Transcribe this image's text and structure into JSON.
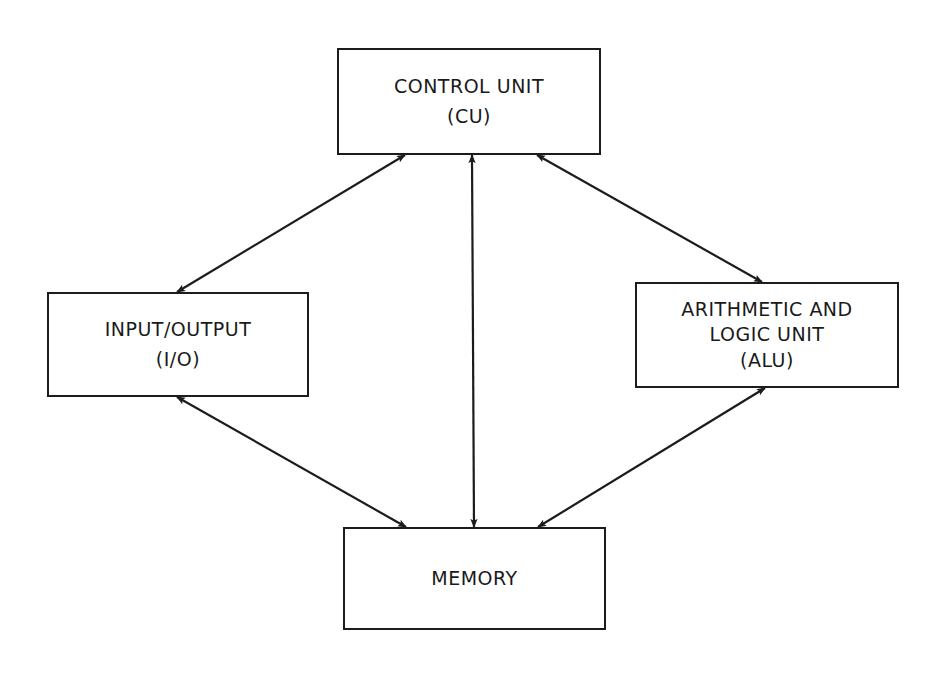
{
  "diagram": {
    "title": "",
    "background": "#ffffff",
    "stroke_color": "#1c1c1c",
    "nodes": {
      "cu": {
        "lines": [
          "CONTROL UNIT",
          "(CU)"
        ]
      },
      "io": {
        "lines": [
          "INPUT/OUTPUT",
          "(I/O)"
        ]
      },
      "alu": {
        "lines": [
          "ARITHMETIC AND",
          "LOGIC UNIT",
          "(ALU)"
        ]
      },
      "memory": {
        "lines": [
          "MEMORY"
        ]
      }
    },
    "edges": [
      {
        "from": "cu",
        "to": "io",
        "direction": "bidirectional"
      },
      {
        "from": "cu",
        "to": "alu",
        "direction": "bidirectional"
      },
      {
        "from": "cu",
        "to": "memory",
        "direction": "bidirectional"
      },
      {
        "from": "io",
        "to": "memory",
        "direction": "bidirectional"
      },
      {
        "from": "alu",
        "to": "memory",
        "direction": "bidirectional"
      }
    ]
  }
}
